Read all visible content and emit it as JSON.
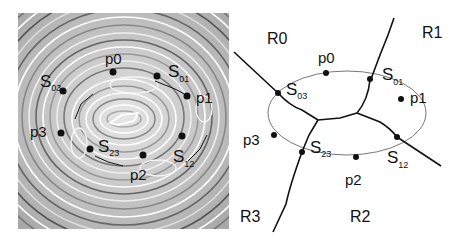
{
  "figure": {
    "left_panel": {
      "description": "Topographic contour pattern (grayscale concentric rings) with points and saddles",
      "points": [
        {
          "label": "p0",
          "x": 113,
          "y": 72
        },
        {
          "label": "p1",
          "x": 187,
          "y": 96
        },
        {
          "label": "p2",
          "x": 143,
          "y": 155
        },
        {
          "label": "p3",
          "x": 61,
          "y": 133
        }
      ],
      "saddles": [
        {
          "label": "S",
          "sub": "03",
          "x": 63,
          "y": 91
        },
        {
          "label": "S",
          "sub": "01",
          "x": 157,
          "y": 76
        },
        {
          "label": "S",
          "sub": "12",
          "x": 182,
          "y": 136
        },
        {
          "label": "S",
          "sub": "23",
          "x": 90,
          "y": 149
        }
      ]
    },
    "right_panel": {
      "regions": [
        "R0",
        "R1",
        "R2",
        "R3"
      ],
      "points": [
        "p0",
        "p1",
        "p2",
        "p3"
      ],
      "saddles": [
        {
          "label": "S",
          "sub": "03"
        },
        {
          "label": "S",
          "sub": "01"
        },
        {
          "label": "S",
          "sub": "12"
        },
        {
          "label": "S",
          "sub": "23"
        }
      ]
    }
  }
}
